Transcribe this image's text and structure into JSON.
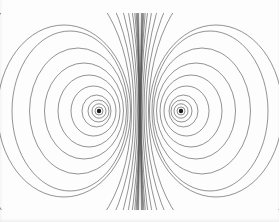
{
  "figure": {
    "kind": "magnetic-dipole-field-line-diagram",
    "background_color": "#fdfdfd",
    "line_color": "#4f4f4f",
    "dot_color": "#1c1c1c",
    "canvas": {
      "width": 279,
      "height": 222
    },
    "plot_clip": {
      "left": 0,
      "right": 279,
      "top": 13,
      "bottom": 210
    },
    "mirror_axis_x": 140,
    "center_y": 111,
    "line_width": 0.7,
    "line_opacity": 0.88,
    "poles": [
      {
        "x": 99,
        "y": 111,
        "dot_radius": 2.2
      },
      {
        "x": 181,
        "y": 111,
        "dot_radius": 2.2
      }
    ],
    "loops": [
      {
        "cx": 99,
        "rx": 4,
        "ry": 4
      },
      {
        "cx": 99,
        "rx": 7,
        "ry": 7.2
      },
      {
        "cx": 98.5,
        "rx": 10.5,
        "ry": 11
      },
      {
        "cx": 96.5,
        "rx": 14.5,
        "ry": 16
      },
      {
        "cx": 93.5,
        "rx": 22.5,
        "ry": 25
      },
      {
        "cx": 89,
        "rx": 31,
        "ry": 36
      },
      {
        "cx": 84,
        "rx": 39.5,
        "ry": 48
      },
      {
        "cx": 78,
        "rx": 48.5,
        "ry": 63
      },
      {
        "cx": 70,
        "rx": 58,
        "ry": 80
      },
      {
        "cx": 64,
        "rx": 66.5,
        "ry": 86
      },
      {
        "cx": 54,
        "rx": 77.5,
        "ry": 135
      },
      {
        "cx": 44,
        "rx": 90,
        "ry": 165
      },
      {
        "cx": 33,
        "rx": 103,
        "ry": 205
      },
      {
        "cx": 21,
        "rx": 116.5,
        "ry": 255
      },
      {
        "cx": 8,
        "rx": 130.8,
        "ry": 320
      },
      {
        "cx": -6,
        "rx": 145.2,
        "ry": 400
      },
      {
        "cx": -21,
        "rx": 160.3,
        "ry": 500
      },
      {
        "cx": -37,
        "rx": 176.3,
        "ry": 630
      },
      {
        "cx": -54,
        "rx": 193.4,
        "ry": 800
      },
      {
        "cx": -72,
        "rx": 211.6,
        "ry": 1020
      }
    ]
  }
}
